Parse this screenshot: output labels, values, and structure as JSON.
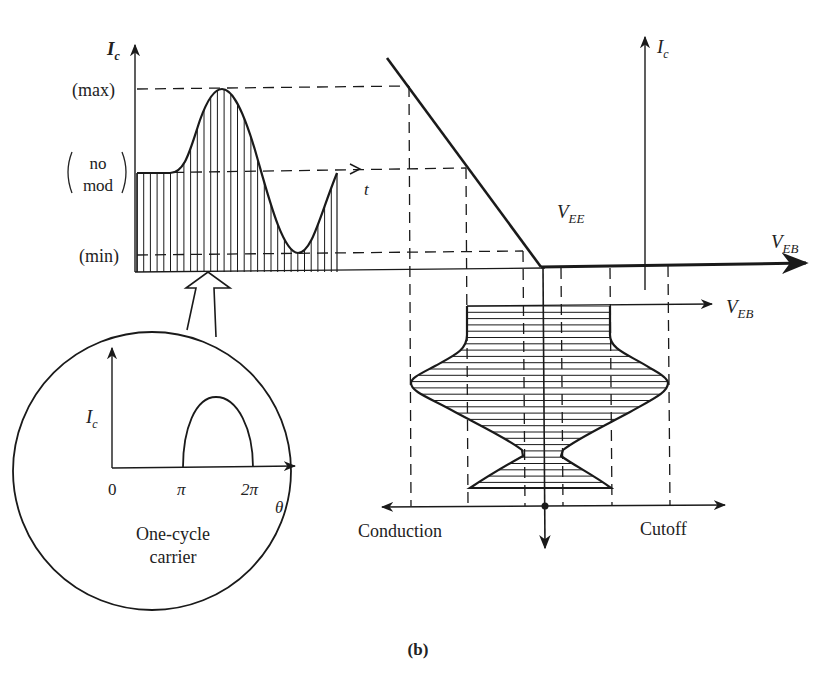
{
  "figure": {
    "caption": "(b)",
    "waveform_panel": {
      "y_axis_label": "I",
      "y_axis_sub": "c",
      "x_axis_label": "t",
      "level_labels": {
        "max": "(max)",
        "no_mod_line1": "no",
        "no_mod_line2": "mod",
        "min": "(min)"
      }
    },
    "transfer_panel": {
      "y_axis_label": "I",
      "y_axis_sub": "c",
      "x_axis_label": "V",
      "x_axis_sub": "EB",
      "bias_label": "V",
      "bias_sub": "EE"
    },
    "input_panel": {
      "x_axis_label": "V",
      "x_axis_sub": "EB",
      "left_label": "Conduction",
      "right_label": "Cutoff"
    },
    "inset": {
      "y_axis_label": "I",
      "y_axis_sub": "c",
      "x_axis_label": "θ",
      "ticks": [
        "0",
        "π",
        "2π"
      ],
      "caption_line1": "One-cycle",
      "caption_line2": "carrier"
    }
  }
}
